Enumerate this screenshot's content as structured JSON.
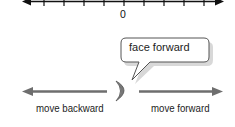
{
  "number_line": {
    "zero_label": "0",
    "tick_positions_x": [
      44,
      64,
      84,
      104,
      124,
      144,
      164,
      184,
      204
    ],
    "zero_tick_x": 124
  },
  "speech_bubble": {
    "text": "face forward"
  },
  "arrows": {
    "backward_label": "move backward",
    "forward_label": "move forward"
  },
  "colors": {
    "line": "#111111",
    "arrow": "#6e6e6e",
    "bubble_border": "#555555",
    "bubble_shadow": "#bbbbbb",
    "text": "#222222"
  }
}
